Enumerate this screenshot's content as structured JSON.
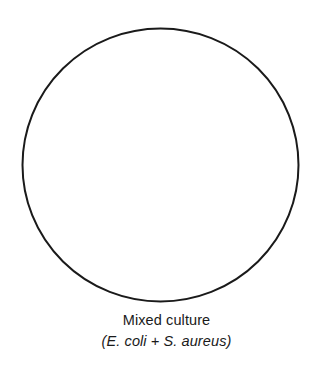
{
  "figure": {
    "type": "diagram",
    "background_color": "#ffffff",
    "dish": {
      "icon_name": "petri-dish-circle",
      "shape": "circle",
      "fill_color": "#ffffff",
      "stroke_color": "#1a1a1a",
      "stroke_width": 2,
      "contents": "",
      "interior_state": "empty"
    },
    "caption": {
      "line1": "Mixed culture",
      "line2": "(E. coli + S. aureus)",
      "text_color": "#1a1a1a"
    }
  }
}
